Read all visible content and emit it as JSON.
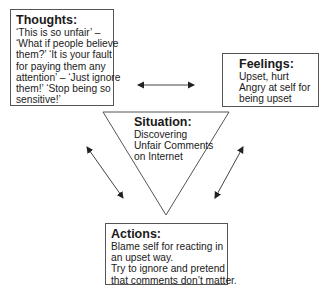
{
  "diagram": {
    "thoughts": {
      "title": "Thoughts:",
      "lines": [
        "‘This is so unfair’ –",
        "‘What if people believe",
        "them?’ ‘It is your fault",
        "for paying them any",
        "attention’ – ‘Just ignore",
        "them!’ ‘Stop being so",
        "sensitive!’"
      ]
    },
    "feelings": {
      "title": "Feelings:",
      "lines": [
        "Upset, hurt",
        "Angry at self for",
        "being upset"
      ]
    },
    "situation": {
      "title": "Situation:",
      "lines": [
        "Discovering",
        "Unfair Comments",
        "on Internet"
      ]
    },
    "actions": {
      "title": "Actions:",
      "lines": [
        "Blame self for reacting in",
        "an upset way.",
        "Try to ignore and pretend",
        "that comments don’t matter."
      ]
    },
    "arrows": [
      {
        "name": "thoughts-feelings",
        "type": "double-headed",
        "from": [
          137,
          85
        ],
        "to": [
          195,
          85
        ]
      },
      {
        "name": "thoughts-actions",
        "type": "double-headed",
        "from": [
          86,
          146
        ],
        "to": [
          124,
          199
        ]
      },
      {
        "name": "feelings-actions",
        "type": "double-headed",
        "from": [
          244,
          146
        ],
        "to": [
          214,
          199
        ]
      }
    ],
    "colors": {
      "stroke": "#555555",
      "arrow": "#333333",
      "text": "#1a1a1a",
      "background": "#ffffff"
    }
  }
}
